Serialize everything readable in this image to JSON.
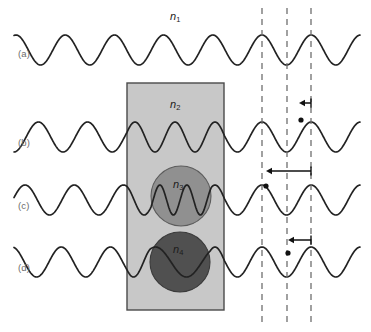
{
  "figure": {
    "width": 371,
    "height": 332,
    "background": "#ffffff",
    "caption_labels": [
      {
        "key": "a",
        "text": "(a)",
        "x": 18,
        "y": 48
      },
      {
        "key": "b",
        "text": "(b)",
        "x": 18,
        "y": 137
      },
      {
        "key": "c",
        "text": "(c)",
        "x": 18,
        "y": 200
      },
      {
        "key": "d",
        "text": "(d)",
        "x": 18,
        "y": 262
      }
    ],
    "index_labels": [
      {
        "key": "n1",
        "base": "n",
        "sub": "1",
        "x": 170,
        "y": 10,
        "color": "#1c1c1c"
      },
      {
        "key": "n2",
        "base": "n",
        "sub": "2",
        "x": 170,
        "y": 98,
        "color": "#1c1c1c"
      },
      {
        "key": "n3",
        "base": "n",
        "sub": "3",
        "x": 173,
        "y": 178,
        "color": "#1c1c1c"
      },
      {
        "key": "n4",
        "base": "n",
        "sub": "4",
        "x": 173,
        "y": 243,
        "color": "#1c1c1c"
      }
    ]
  },
  "colors": {
    "wave_stroke": "#222222",
    "slab_fill": "#c8c8c8",
    "slab_stroke": "#4a4a4a",
    "circle_n3_fill": "#909090",
    "circle_n3_stroke": "#5c5c5c",
    "circle_n4_fill": "#505050",
    "circle_n4_stroke": "#3a3a3a",
    "dashed_line": "#6f6f6f",
    "arrow": "#111111",
    "marker_dot": "#111111",
    "label_gray": "#6b6b6b"
  },
  "slab": {
    "name": "medium-n2-slab",
    "x": 127,
    "y": 83,
    "width": 97,
    "height": 227,
    "fill": "#c8c8c8",
    "stroke": "#4a4a4a"
  },
  "circles": [
    {
      "name": "medium-n3-circle",
      "cx": 181,
      "cy": 196,
      "r": 30,
      "fill": "#909090",
      "stroke": "#5c5c5c"
    },
    {
      "name": "medium-n4-circle",
      "cx": 180,
      "cy": 262,
      "r": 30,
      "fill": "#505050",
      "stroke": "#3a3a3a"
    }
  ],
  "reference_lines": [
    {
      "name": "reference-line-1",
      "x": 262,
      "y1": 8,
      "y2": 326
    },
    {
      "name": "reference-line-2",
      "x": 287,
      "y1": 8,
      "y2": 326
    },
    {
      "name": "reference-line-3",
      "x": 311,
      "y1": 8,
      "y2": 326
    }
  ],
  "shift_arrows": [
    {
      "name": "phase-shift-arrow-b",
      "x_from": 311,
      "x_to": 299,
      "y": 103
    },
    {
      "name": "phase-shift-arrow-c",
      "x_from": 311,
      "x_to": 266,
      "y": 171
    },
    {
      "name": "phase-shift-arrow-d",
      "x_from": 311,
      "x_to": 288,
      "y": 240
    }
  ],
  "crest_markers": [
    {
      "name": "crest-marker-b",
      "cx": 301,
      "cy": 120,
      "r": 2.6
    },
    {
      "name": "crest-marker-c",
      "cx": 266,
      "cy": 186,
      "r": 2.6
    },
    {
      "name": "crest-marker-d",
      "cx": 288,
      "cy": 253,
      "r": 2.6
    }
  ],
  "chart_data": {
    "type": "line",
    "title": "",
    "xlabel": "",
    "ylabel": "",
    "grid": false,
    "legend": "none",
    "xlim": [
      14,
      360
    ],
    "x_axis_note": "horizontal propagation direction, pixels",
    "reference_x": [
      262,
      287,
      311
    ],
    "series": [
      {
        "name": "(a) n1 only",
        "baseline_y": 50,
        "amplitude": 15,
        "wavelength_outside": 49.2,
        "wavelength_inside_slab": 49.2,
        "wavelength_inside_circle": 49.2,
        "phase_shift_px": 0,
        "x_start": 14,
        "x_end": 360
      },
      {
        "name": "(b) n1 + n2 slab",
        "baseline_y": 137,
        "amplitude": 15,
        "wavelength_outside": 49.2,
        "wavelength_inside_slab": 40.0,
        "wavelength_inside_circle": 40.0,
        "phase_shift_px": 10,
        "x_start": 14,
        "x_end": 360
      },
      {
        "name": "(c) n1 + n2 + n3 sphere",
        "baseline_y": 200,
        "amplitude": 15,
        "wavelength_outside": 49.2,
        "wavelength_inside_slab": 40.0,
        "wavelength_inside_circle": 27.0,
        "phase_shift_px": 45,
        "x_start": 14,
        "x_end": 360
      },
      {
        "name": "(d) n1 + n2 + n4 sphere",
        "baseline_y": 262,
        "amplitude": 15,
        "wavelength_outside": 49.2,
        "wavelength_inside_slab": 40.0,
        "wavelength_inside_circle": 62.0,
        "phase_shift_px": 23,
        "x_start": 14,
        "x_end": 360
      }
    ]
  }
}
